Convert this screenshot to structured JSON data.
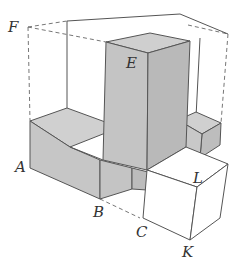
{
  "figure": {
    "type": "3d-solid-diagram",
    "colors": {
      "shaded_face": "#c8c8c8",
      "shaded_face_light": "#d2d2d2",
      "shaded_face_dark": "#bdbdbd",
      "edge": "#555555",
      "background": "#ffffff"
    },
    "labels": {
      "A": "A",
      "B": "B",
      "C": "C",
      "E": "E",
      "F": "F",
      "K": "K",
      "L": "L"
    }
  }
}
